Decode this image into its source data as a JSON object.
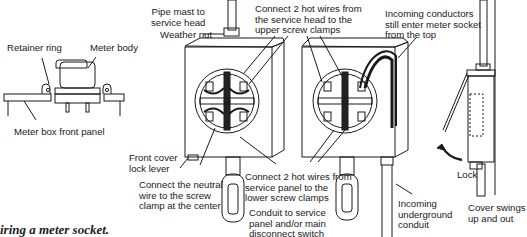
{
  "figure": {
    "caption": "iring a meter socket.",
    "inset_labels": {
      "retainer_ring": "Retainer ring",
      "meter_body": "Meter body",
      "front_panel": "Meter box front panel"
    },
    "labels": {
      "pipe_mast": [
        "Pipe mast to",
        "service head"
      ],
      "weather_nut": "Weather nut",
      "upper_clamps": [
        "Connect 2 hot wires from",
        "the service head to the",
        "upper screw clamps"
      ],
      "incoming_conductors": [
        "Incoming conductors",
        "still enter meter socket",
        "from the top"
      ],
      "front_cover_lock": [
        "Front cover",
        "lock lever"
      ],
      "neutral": [
        "Connect the neutral",
        "wire to the screw",
        "clamp at the center"
      ],
      "lower_clamps": [
        "Connect 2 hot wires from",
        "service panel to the",
        "lower screw clamps"
      ],
      "conduit": [
        "Conduit to service",
        "panel and/or main",
        "disconnect switch"
      ],
      "underground": [
        "Incoming",
        "underground",
        "conduit"
      ],
      "lock": "Lock",
      "cover_swings": [
        "Cover swings",
        "up and out"
      ]
    },
    "line_color": "#1a1a1a"
  }
}
